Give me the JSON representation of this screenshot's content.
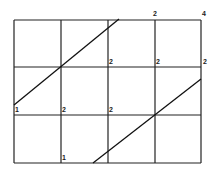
{
  "diagram": {
    "type": "grid-with-diagonals",
    "grid": {
      "columns": 4,
      "rows": 3,
      "x_lines": [
        14,
        61,
        108,
        155,
        201
      ],
      "y_lines": [
        20,
        67,
        115,
        163
      ],
      "color": "#222222"
    },
    "diagonals": [
      {
        "name": "upper-diagonal",
        "x1": 14,
        "y1": 105,
        "x2": 119,
        "y2": 19
      },
      {
        "name": "lower-diagonal",
        "x1": 93,
        "y1": 163,
        "x2": 201,
        "y2": 79
      }
    ],
    "labels": [
      {
        "text": "2",
        "x": 153,
        "y": 16
      },
      {
        "text": "4",
        "x": 202,
        "y": 16
      },
      {
        "text": "2",
        "x": 109,
        "y": 64
      },
      {
        "text": "2",
        "x": 156,
        "y": 64
      },
      {
        "text": "2",
        "x": 203,
        "y": 64
      },
      {
        "text": "1",
        "x": 15,
        "y": 112
      },
      {
        "text": "2",
        "x": 62,
        "y": 112
      },
      {
        "text": "2",
        "x": 109,
        "y": 112
      },
      {
        "text": "1",
        "x": 62,
        "y": 160
      }
    ]
  }
}
